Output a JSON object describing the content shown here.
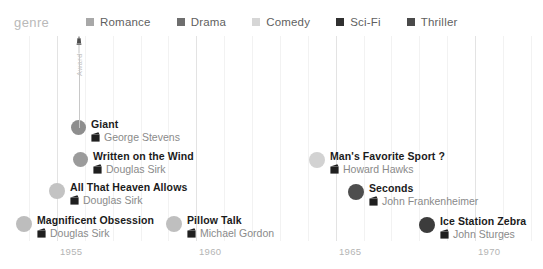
{
  "legend": {
    "title": "genre",
    "items": [
      {
        "label": "Romance",
        "color": "#a8a8a8",
        "icon": "legend-swatch-icon"
      },
      {
        "label": "Drama",
        "color": "#6e6e6e",
        "icon": "legend-swatch-icon"
      },
      {
        "label": "Comedy",
        "color": "#d6d6d6",
        "icon": "legend-swatch-icon"
      },
      {
        "label": "Sci-Fi",
        "color": "#303030",
        "icon": "legend-swatch-icon"
      },
      {
        "label": "Thriller",
        "color": "#4a4a4a",
        "icon": "legend-swatch-icon"
      }
    ]
  },
  "award": {
    "label": "Award",
    "icon": "oscar-statuette-icon",
    "attached_to": "Giant"
  },
  "axis": {
    "ticks": [
      "1955",
      "1960",
      "1965",
      "1970"
    ],
    "tick_x": [
      57,
      196,
      336,
      475
    ],
    "range": [
      1954.2,
      1970.6
    ]
  },
  "chart_data": {
    "type": "scatter",
    "title": "",
    "xlabel": "",
    "ylabel": "",
    "xlim": [
      1954.2,
      1970.6
    ],
    "grid": true,
    "legend_position": "top",
    "categories": [
      "Romance",
      "Drama",
      "Comedy",
      "Sci-Fi",
      "Thriller"
    ],
    "points": [
      {
        "title": "Giant",
        "director": "George Stevens",
        "year": "1956",
        "genre": "Drama",
        "color": "#8e8e8e",
        "award": true,
        "x": 71,
        "y": 84,
        "r": 7.5
      },
      {
        "title": "Written on the Wind",
        "director": "Douglas Sirk",
        "year": "1956",
        "genre": "Romance",
        "color": "#9b9b9b",
        "award": false,
        "x": 73,
        "y": 116,
        "r": 7.5
      },
      {
        "title": "All That Heaven Allows",
        "director": "Douglas Sirk",
        "year": "1955",
        "genre": "Romance",
        "color": "#c3c3c3",
        "award": false,
        "x": 49,
        "y": 147,
        "r": 8.0
      },
      {
        "title": "Magnificent Obsession",
        "director": "Douglas Sirk",
        "year": "1954",
        "genre": "Romance",
        "color": "#bdbdbd",
        "award": false,
        "x": 16,
        "y": 180,
        "r": 8.0
      },
      {
        "title": "Pillow Talk",
        "director": "Michael Gordon",
        "year": "1959",
        "genre": "Comedy",
        "color": "#bfbfbf",
        "award": false,
        "x": 166,
        "y": 180,
        "r": 8.0
      },
      {
        "title": "Man's Favorite Sport ?",
        "director": "Howard Hawks",
        "year": "1964",
        "genre": "Comedy",
        "color": "#d2d2d2",
        "award": false,
        "x": 309,
        "y": 116,
        "r": 8.0
      },
      {
        "title": "Seconds",
        "director": "John Frankenheimer",
        "year": "1966",
        "genre": "Sci-Fi",
        "color": "#4e4e4e",
        "award": false,
        "x": 348,
        "y": 148,
        "r": 8.0
      },
      {
        "title": "Ice Station Zebra",
        "director": "John Sturges",
        "year": "1968",
        "genre": "Thriller",
        "color": "#3c3c3c",
        "award": false,
        "x": 419,
        "y": 181,
        "r": 8.0
      }
    ],
    "gridlines_major_x": [
      57,
      196,
      336,
      475
    ],
    "gridlines_minor_x": [
      29,
      85,
      113,
      141,
      168,
      224,
      252,
      280,
      308,
      364,
      391,
      419,
      447,
      503,
      531
    ]
  }
}
